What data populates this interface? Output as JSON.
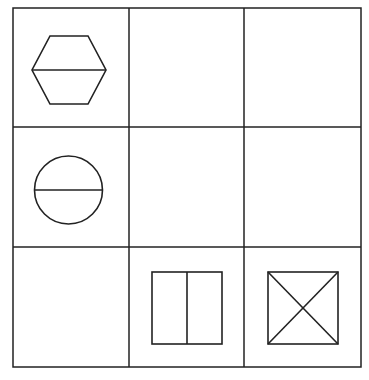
{
  "puzzle": {
    "type": "3x3 figure matrix",
    "rows": 3,
    "cols": 3,
    "line_color": "#222222",
    "background": "#ffffff",
    "cells": [
      {
        "row": 1,
        "col": 1,
        "figure": "hexagon-with-horizontal-line"
      },
      {
        "row": 1,
        "col": 2,
        "figure": "empty"
      },
      {
        "row": 1,
        "col": 3,
        "figure": "empty"
      },
      {
        "row": 2,
        "col": 1,
        "figure": "circle-with-horizontal-line"
      },
      {
        "row": 2,
        "col": 2,
        "figure": "empty"
      },
      {
        "row": 2,
        "col": 3,
        "figure": "empty"
      },
      {
        "row": 3,
        "col": 1,
        "figure": "empty"
      },
      {
        "row": 3,
        "col": 2,
        "figure": "square-with-vertical-line"
      },
      {
        "row": 3,
        "col": 3,
        "figure": "square-with-diagonal-cross"
      }
    ]
  }
}
